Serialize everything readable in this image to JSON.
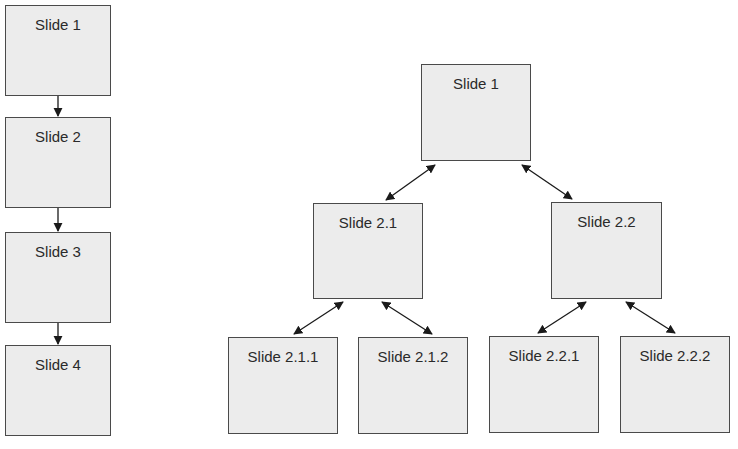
{
  "linear": {
    "slides": [
      {
        "label": "Slide 1"
      },
      {
        "label": "Slide 2"
      },
      {
        "label": "Slide 3"
      },
      {
        "label": "Slide 4"
      }
    ],
    "connector": "one-way-arrow-down"
  },
  "tree": {
    "root": {
      "label": "Slide 1"
    },
    "level2": [
      {
        "label": "Slide 2.1"
      },
      {
        "label": "Slide 2.2"
      }
    ],
    "level3": [
      {
        "label": "Slide 2.1.1",
        "parent": "Slide 2.1"
      },
      {
        "label": "Slide 2.1.2",
        "parent": "Slide 2.1"
      },
      {
        "label": "Slide 2.2.1",
        "parent": "Slide 2.2"
      },
      {
        "label": "Slide 2.2.2",
        "parent": "Slide 2.2"
      }
    ],
    "connector": "two-way-arrow"
  },
  "colors": {
    "box_fill": "#ececec",
    "box_border": "#4a4a4a",
    "arrow": "#1a1a1a",
    "text": "#2a2a2a"
  }
}
